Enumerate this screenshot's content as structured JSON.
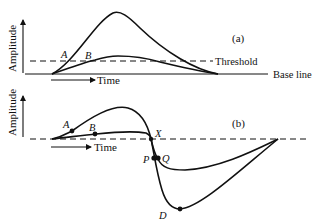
{
  "panels": [
    {
      "id": "a",
      "label": "(a)",
      "y_axis_label": "Amplitude",
      "x_axis_label": "Time",
      "threshold_label": "Threshold",
      "baseline_label": "Base line",
      "points": [
        {
          "name": "A",
          "label": "A"
        },
        {
          "name": "B",
          "label": "B"
        }
      ]
    },
    {
      "id": "b",
      "label": "(b)",
      "y_axis_label": "Amplitude",
      "x_axis_label": "Time",
      "points": [
        {
          "name": "A",
          "label": "A"
        },
        {
          "name": "B",
          "label": "B"
        },
        {
          "name": "X",
          "label": "X"
        },
        {
          "name": "P",
          "label": "P"
        },
        {
          "name": "Q",
          "label": "Q"
        },
        {
          "name": "D",
          "label": "D"
        }
      ]
    }
  ],
  "colors": {
    "ink": "#111111",
    "background": "#ffffff"
  }
}
